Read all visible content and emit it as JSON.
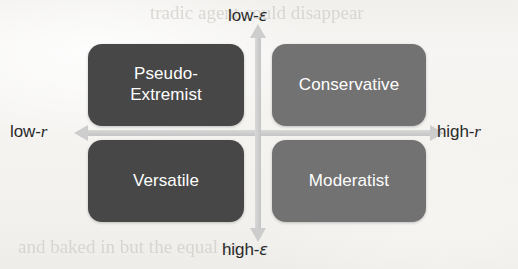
{
  "figure": {
    "type": "2x2-quadrant-matrix",
    "background_color": "#f4f3f1",
    "axis_color": "#cdcdcd",
    "dark_box_color": "#474747",
    "light_box_color": "#727272",
    "box_text_color": "#ffffff",
    "axis_label_color": "#2a2a2a"
  },
  "axes": {
    "vertical": {
      "top_label": "low-ε",
      "top_label_prefix": "low-",
      "top_label_symbol": "ε",
      "bottom_label": "high-ε",
      "bottom_label_prefix": "high-",
      "bottom_label_symbol": "ε",
      "variable": "ε",
      "direction": "low at top, high at bottom"
    },
    "horizontal": {
      "left_label": "low-r",
      "left_label_prefix": "low-",
      "left_label_symbol": "r",
      "right_label": "high-r",
      "right_label_prefix": "high-",
      "right_label_symbol": "r",
      "variable": "r",
      "direction": "low at left, high at right"
    }
  },
  "quadrants": [
    {
      "id": "top-left",
      "label": "Pseudo-Extremist",
      "line1": "Pseudo-",
      "line2": "Extremist",
      "shade": "dark",
      "color": "#474747",
      "position": {
        "r": "low",
        "epsilon": "low"
      }
    },
    {
      "id": "top-right",
      "label": "Conservative",
      "line1": "Conservative",
      "line2": "",
      "shade": "light",
      "color": "#727272",
      "position": {
        "r": "high",
        "epsilon": "low"
      }
    },
    {
      "id": "bottom-left",
      "label": "Versatile",
      "line1": "Versatile",
      "line2": "",
      "shade": "dark",
      "color": "#474747",
      "position": {
        "r": "low",
        "epsilon": "high"
      }
    },
    {
      "id": "bottom-right",
      "label": "Moderatist",
      "line1": "Moderatist",
      "line2": "",
      "shade": "light",
      "color": "#727272",
      "position": {
        "r": "high",
        "epsilon": "high"
      }
    }
  ],
  "bleed_through": {
    "top": "tradic agent could disappear",
    "upper_right": "",
    "bottom": "and baked in but the equal to"
  }
}
